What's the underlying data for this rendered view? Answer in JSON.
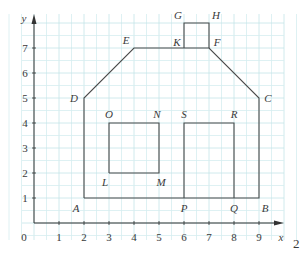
{
  "figure": {
    "page_number": "2",
    "colors": {
      "grid_minor": "#d6eef0",
      "grid_major": "#c4e4e8",
      "axis": "#333333",
      "outline": "#4a4a4a",
      "text": "#3a3a3a"
    },
    "axes": {
      "x_label": "x",
      "y_label": "y",
      "origin_label": "0",
      "x_ticks": [
        "1",
        "2",
        "3",
        "4",
        "5",
        "6",
        "7",
        "8",
        "9"
      ],
      "y_ticks": [
        "1",
        "2",
        "3",
        "4",
        "5",
        "6",
        "7"
      ]
    },
    "points": [
      {
        "name": "A",
        "x": 2,
        "y": 1
      },
      {
        "name": "B",
        "x": 9,
        "y": 1
      },
      {
        "name": "C",
        "x": 9,
        "y": 5
      },
      {
        "name": "D",
        "x": 2,
        "y": 5
      },
      {
        "name": "E",
        "x": 4,
        "y": 7
      },
      {
        "name": "F",
        "x": 7,
        "y": 7
      },
      {
        "name": "G",
        "x": 6,
        "y": 8
      },
      {
        "name": "H",
        "x": 7,
        "y": 8
      },
      {
        "name": "K",
        "x": 6,
        "y": 7
      },
      {
        "name": "L",
        "x": 3,
        "y": 2
      },
      {
        "name": "M",
        "x": 5,
        "y": 2
      },
      {
        "name": "N",
        "x": 5,
        "y": 4
      },
      {
        "name": "O",
        "x": 3,
        "y": 4
      },
      {
        "name": "P",
        "x": 6,
        "y": 1
      },
      {
        "name": "Q",
        "x": 8,
        "y": 1
      },
      {
        "name": "R",
        "x": 8,
        "y": 4
      },
      {
        "name": "S",
        "x": 6,
        "y": 4
      }
    ],
    "shapes": {
      "house_outline": "A-B-C-F-E-D-A",
      "chimney": "K-G-H-F",
      "window": "L-M-N-O-L",
      "door": "P-S-R-Q"
    }
  }
}
